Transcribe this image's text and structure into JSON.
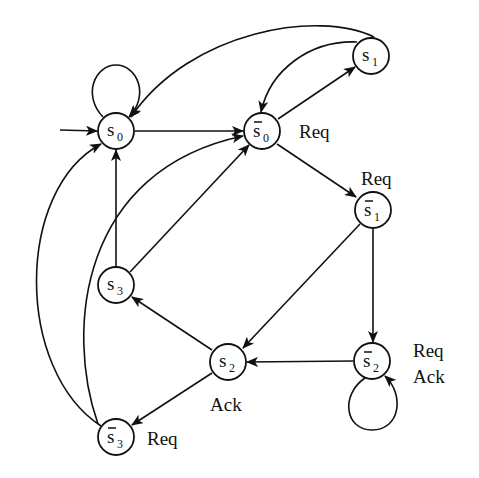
{
  "diagram": {
    "type": "state-transition-graph",
    "nodes": [
      {
        "id": "s0",
        "base": "s",
        "sub": "0",
        "bar": false,
        "x": 116,
        "y": 131
      },
      {
        "id": "s0bar",
        "base": "s",
        "sub": "0",
        "bar": true,
        "x": 262,
        "y": 131
      },
      {
        "id": "s1",
        "base": "s",
        "sub": "1",
        "bar": false,
        "x": 371,
        "y": 56
      },
      {
        "id": "s1bar",
        "base": "s",
        "sub": "1",
        "bar": true,
        "x": 373,
        "y": 210
      },
      {
        "id": "s3",
        "base": "s",
        "sub": "3",
        "bar": false,
        "x": 116,
        "y": 285
      },
      {
        "id": "s2",
        "base": "s",
        "sub": "2",
        "bar": false,
        "x": 228,
        "y": 362
      },
      {
        "id": "s2bar",
        "base": "s",
        "sub": "2",
        "bar": true,
        "x": 372,
        "y": 361
      },
      {
        "id": "s3bar",
        "base": "s",
        "sub": "3",
        "bar": true,
        "x": 116,
        "y": 437
      }
    ],
    "annotations": [
      {
        "node": "s0bar",
        "text": "Req",
        "x": 299,
        "y": 138
      },
      {
        "node": "s1bar",
        "text": "Req",
        "x": 361,
        "y": 185
      },
      {
        "node": "s2bar",
        "text": "Req",
        "x": 413,
        "y": 357
      },
      {
        "node": "s2bar",
        "text": "Ack",
        "x": 413,
        "y": 383
      },
      {
        "node": "s2",
        "text": "Ack",
        "x": 210,
        "y": 411
      },
      {
        "node": "s3bar",
        "text": "Req",
        "x": 147,
        "y": 445
      }
    ],
    "edges": [
      {
        "from": "init",
        "to": "s0"
      },
      {
        "from": "s0",
        "to": "s0",
        "kind": "self-loop"
      },
      {
        "from": "s0",
        "to": "s0bar"
      },
      {
        "from": "s0bar",
        "to": "s1"
      },
      {
        "from": "s1",
        "to": "s0bar"
      },
      {
        "from": "s1",
        "to": "s0"
      },
      {
        "from": "s0bar",
        "to": "s1bar"
      },
      {
        "from": "s1bar",
        "to": "s2bar"
      },
      {
        "from": "s1bar",
        "to": "s2"
      },
      {
        "from": "s2bar",
        "to": "s2bar",
        "kind": "self-loop"
      },
      {
        "from": "s2bar",
        "to": "s2"
      },
      {
        "from": "s2",
        "to": "s3"
      },
      {
        "from": "s2",
        "to": "s3bar"
      },
      {
        "from": "s3",
        "to": "s0"
      },
      {
        "from": "s3",
        "to": "s0bar"
      },
      {
        "from": "s3bar",
        "to": "s0"
      },
      {
        "from": "s3bar",
        "to": "s0bar"
      }
    ]
  }
}
